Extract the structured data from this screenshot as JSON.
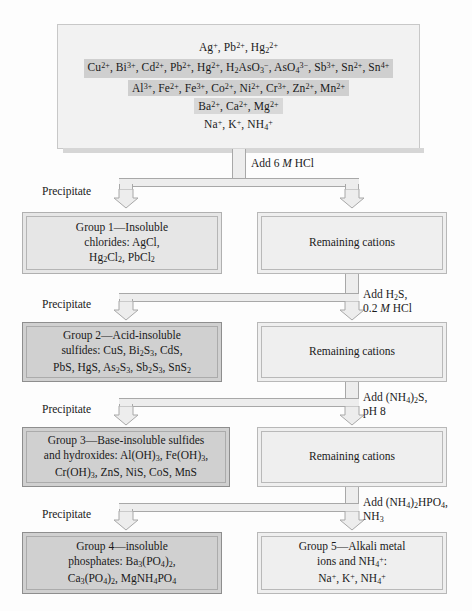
{
  "chart_data": {
    "type": "diagram",
    "top_box": {
      "name": "unknown-mixture",
      "rows": [
        {
          "html": "Ag<sup>+</sup>, Pb<sup>2+</sup>, Hg<sub>2</sub><sup>2+</sup>",
          "band": "none"
        },
        {
          "html": "Cu<sup>2+</sup>, Bi<sup>3+</sup>, Cd<sup>2+</sup>, Pb<sup>2+</sup>, Hg<sup>2+</sup>, H<sub>2</sub>AsO<sub>3</sub><sup>&minus;</sup>, AsO<sub>4</sub><sup>3&minus;</sup>, Sb<sup>3+</sup>, Sn<sup>2+</sup>, Sn<sup>4+</sup>",
          "band": "dark"
        },
        {
          "html": "Al<sup>3+</sup>, Fe<sup>2+</sup>, Fe<sup>3+</sup>, Co<sup>2+</sup>, Ni<sup>2+</sup>, Cr<sup>3+</sup>, Zn<sup>2+</sup>, Mn<sup>2+</sup>",
          "band": "dark"
        },
        {
          "html": "Ba<sup>2+</sup>, Ca<sup>2+</sup>, Mg<sup>2+</sup>",
          "band": "light"
        },
        {
          "html": "Na<sup>+</sup>, K<sup>+</sup>, NH<sub>4</sub><sup>+</sup>",
          "band": "none"
        }
      ]
    },
    "steps": [
      {
        "reagent_html": "Add 6 <i>M</i> HCl",
        "precipitate_label": "Precipitate",
        "precipitate_box_html": "Group 1&mdash;Insoluble<br>chlorides: AgCl,<br>Hg<sub>2</sub>Cl<sub>2</sub>, PbCl<sub>2</sub>",
        "filtrate_box_html": "Remaining cations"
      },
      {
        "reagent_html": "Add H<sub>2</sub>S,<br>0.2 <i>M</i> HCl",
        "precipitate_label": "Precipitate",
        "precipitate_box_html": "Group 2&mdash;Acid-insoluble<br>sulfides: CuS, Bi<sub>2</sub>S<sub>3</sub>, CdS,<br>PbS, HgS, As<sub>2</sub>S<sub>3</sub>, Sb<sub>2</sub>S<sub>3</sub>, SnS<sub>2</sub>",
        "filtrate_box_html": "Remaining cations"
      },
      {
        "reagent_html": "Add (NH<sub>4</sub>)<sub>2</sub>S,<br>pH 8",
        "precipitate_label": "Precipitate",
        "precipitate_box_html": "Group 3&mdash;Base-insoluble sulfides<br>and hydroxides: Al(OH)<sub>3</sub>, Fe(OH)<sub>3</sub>,<br>Cr(OH)<sub>3</sub>, ZnS, NiS, CoS, MnS",
        "filtrate_box_html": "Remaining cations"
      },
      {
        "reagent_html": "Add (NH<sub>4</sub>)<sub>2</sub>HPO<sub>4</sub>,<br>NH<sub>3</sub>",
        "precipitate_label": "Precipitate",
        "precipitate_box_html": "Group 4&mdash;insoluble<br>phosphates: Ba<sub>3</sub>(PO<sub>4</sub>)<sub>2</sub>,<br>Ca<sub>3</sub>(PO<sub>4</sub>)<sub>2</sub>, MgNH<sub>4</sub>PO<sub>4</sub>",
        "filtrate_box_html": "Group 5&mdash;Alkali metal<br>ions and NH<sub>4</sub><sup>+</sup>:<br>Na<sup>+</sup>, K<sup>+</sup>, NH<sub>4</sub><sup>+</sup>"
      }
    ],
    "colors": {
      "page_background": "#fdfdfd",
      "box_fill_light": "#f0f0f0",
      "box_fill_group": "#d0d0d0",
      "box_border": "#a8a8a8",
      "band_dark": "#cfcfcf",
      "band_light": "#d8d8d8",
      "arrow_fill": "#ededed",
      "arrow_stroke": "#a8a8a8",
      "shadow": "#d3d3d3",
      "text": "#1a1a1a"
    }
  }
}
